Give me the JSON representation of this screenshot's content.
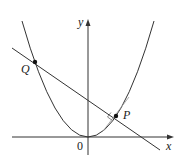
{
  "diagram": {
    "type": "parabola-with-normal-line",
    "axes": {
      "x_label": "x",
      "y_label": "y",
      "origin_label": "0"
    },
    "points": [
      {
        "name": "Q",
        "label": "Q"
      },
      {
        "name": "P",
        "label": "P"
      }
    ],
    "elements": [
      "parabola y = c·x²",
      "line through Q and P (normal at P)",
      "tangent segment at P",
      "right-angle marker at P"
    ],
    "colors": {
      "stroke": "#333333",
      "tangent": "#888888"
    }
  }
}
